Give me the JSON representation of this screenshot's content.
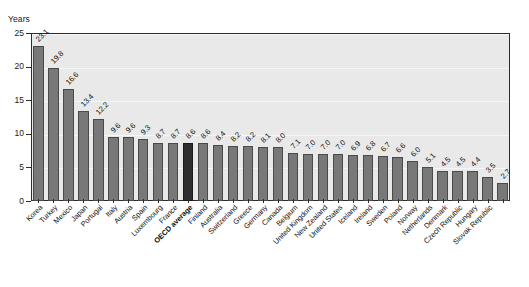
{
  "top_strip_text": "",
  "axis": {
    "y_title": "Years",
    "y_ticks": [
      "25",
      "20",
      "15",
      "10",
      "5",
      "0"
    ]
  },
  "colors": {
    "bar": "#787878",
    "bar_highlight": "#2e2e2e",
    "plot_background": "#e9e9e9",
    "frame": "#2b2b2b",
    "text": "#111111"
  },
  "chart_data": {
    "type": "bar",
    "title": "",
    "xlabel": "",
    "ylabel": "Years",
    "ylim": [
      0,
      25
    ],
    "ytick_values": [
      0,
      5,
      10,
      15,
      20,
      25
    ],
    "grid": true,
    "legend": "none",
    "highlight_category": "OECD average",
    "categories": [
      "Korea",
      "Turkey",
      "Mexico",
      "Japan",
      "Portugal",
      "Italy",
      "Austria",
      "Spain",
      "Luxembourg",
      "France",
      "OECD average",
      "Finland",
      "Australia",
      "Switzerland",
      "Greece",
      "Germany",
      "Canada",
      "Belgium",
      "United Kingdom",
      "New Zealand",
      "United States",
      "Iceland",
      "Ireland",
      "Sweden",
      "Poland",
      "Norway",
      "Netherlands",
      "Denmark",
      "Czech Republic",
      "Hungary",
      "Slovak Republic"
    ],
    "values": [
      23.1,
      19.8,
      16.6,
      13.4,
      12.2,
      9.6,
      9.6,
      9.3,
      8.7,
      8.7,
      8.6,
      8.6,
      8.4,
      8.2,
      8.2,
      8.1,
      8.0,
      7.1,
      7.0,
      7.0,
      7.0,
      6.9,
      6.8,
      6.7,
      6.6,
      6.0,
      5.1,
      4.5,
      4.5,
      4.4,
      3.5
    ],
    "value_labels": [
      "23.1",
      "19.8",
      "16.6",
      "13.4",
      "12.2",
      "9.6",
      "9.6",
      "9.3",
      "8.7",
      "8.7",
      "8.6",
      "8.6",
      "8.4",
      "8.2",
      "8.2",
      "8.1",
      "8.0",
      "7.1",
      "7.0",
      "7.0",
      "7.0",
      "6.9",
      "6.8",
      "6.7",
      "6.6",
      "6.0",
      "5.1",
      "4.5",
      "4.5",
      "4.4",
      "3.5"
    ],
    "last_value_label": "2.7",
    "last_value": 2.7
  }
}
